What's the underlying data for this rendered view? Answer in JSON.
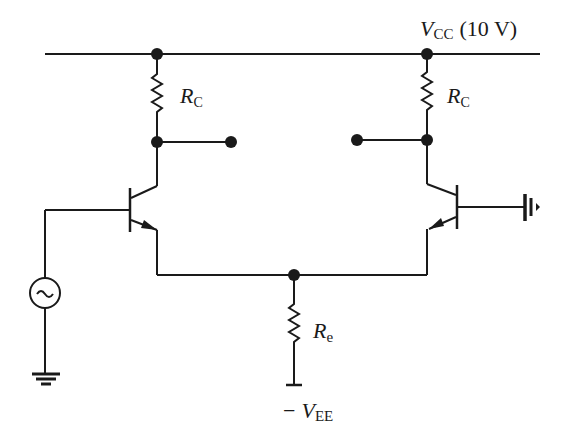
{
  "diagram": {
    "type": "circuit-schematic",
    "supply": {
      "vcc_symbol": "V",
      "vcc_sub": "CC",
      "vcc_value": "(10 V)",
      "vee_prefix": "−",
      "vee_symbol": "V",
      "vee_sub": "EE"
    },
    "resistors": [
      {
        "id": "rc-left",
        "symbol": "R",
        "sub": "C"
      },
      {
        "id": "rc-right",
        "symbol": "R",
        "sub": "C"
      },
      {
        "id": "re",
        "symbol": "R",
        "sub": "e"
      }
    ],
    "components": [
      {
        "id": "q1",
        "kind": "npn-transistor",
        "position": "left"
      },
      {
        "id": "q2",
        "kind": "npn-transistor",
        "position": "right"
      },
      {
        "id": "vs",
        "kind": "ac-voltage-source",
        "glyph": "~"
      },
      {
        "id": "gnd-left",
        "kind": "ground"
      },
      {
        "id": "gnd-right",
        "kind": "ground"
      },
      {
        "id": "out-left",
        "kind": "output-terminal"
      },
      {
        "id": "out-right",
        "kind": "output-terminal"
      }
    ],
    "colors": {
      "ink": "#1a1a1a",
      "background": "#ffffff"
    }
  }
}
